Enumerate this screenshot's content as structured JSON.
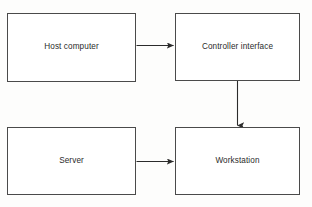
{
  "diagram": {
    "background_color": "#fdfdfc",
    "stroke_color": "#4a4a4a",
    "text_color": "#2b2b2b",
    "nodes": [
      {
        "id": "host-computer",
        "label": "Host computer"
      },
      {
        "id": "controller-interface",
        "label": "Controller interface"
      },
      {
        "id": "server",
        "label": "Server"
      },
      {
        "id": "workstation",
        "label": "Workstation"
      }
    ],
    "connectors": [
      {
        "id": "host-to-controller",
        "from": "host-computer",
        "to": "controller-interface",
        "direction": "right"
      },
      {
        "id": "controller-to-workstation",
        "from": "controller-interface",
        "to": "workstation",
        "direction": "down"
      },
      {
        "id": "server-to-workstation",
        "from": "server",
        "to": "workstation",
        "direction": "right"
      }
    ]
  }
}
